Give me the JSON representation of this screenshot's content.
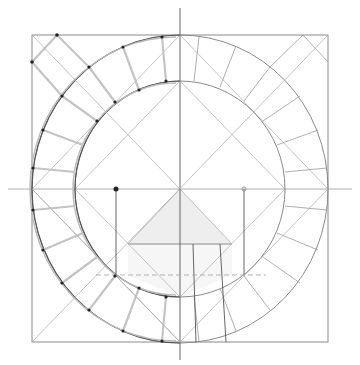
{
  "diagram": {
    "caption_cutoff": "",
    "colors": {
      "line": "#8a8a8a",
      "thin_line": "#b5b5b5",
      "dark_line": "#444444",
      "fill_light": "#f0f0f0",
      "fill_lighter": "#f6f6f6",
      "point": "#222222",
      "background": "#ffffff"
    },
    "geometry": {
      "center": [
        180,
        189
      ],
      "square": {
        "x1": 32,
        "y1": 35,
        "x2": 328,
        "y2": 342
      },
      "outer_radius_x": 148,
      "outer_radius_y": 154,
      "inner_radius_x": 105,
      "inner_radius_y": 108,
      "axis_vertical": {
        "x": 180,
        "y1": 8,
        "y2": 360
      },
      "axis_horizontal": {
        "y": 189,
        "x1": 8,
        "x2": 352
      },
      "triangle": [
        [
          180,
          189
        ],
        [
          128,
          244
        ],
        [
          232,
          244
        ]
      ],
      "lower_rect": {
        "x1": 128,
        "y1": 244,
        "x2": 232,
        "y2": 275
      },
      "dashed_line_y": 275,
      "drop_lines": [
        {
          "x": 116,
          "y1": 189,
          "y2": 275
        },
        {
          "x": 244,
          "y1": 189,
          "y2": 275
        },
        {
          "x": 193,
          "y1": 244,
          "y2": 342
        },
        {
          "x": 220,
          "y1": 244,
          "y2": 342
        }
      ],
      "marked_points": [
        [
          116,
          189
        ],
        [
          57,
          35
        ],
        [
          32,
          62
        ]
      ]
    }
  }
}
